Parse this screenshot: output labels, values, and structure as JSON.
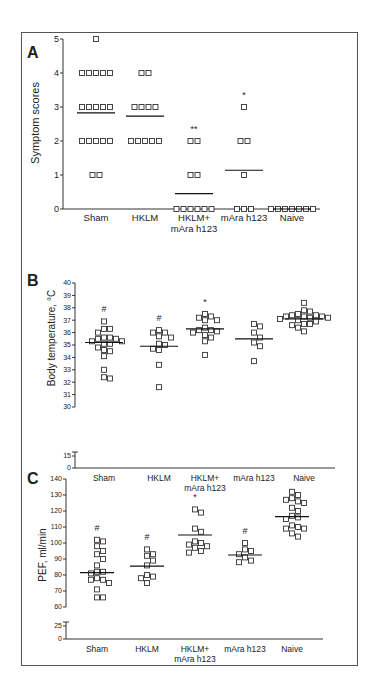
{
  "figure": {
    "panels": [
      "A",
      "B",
      "C"
    ]
  },
  "chart_data": [
    {
      "panel": "A",
      "type": "scatter",
      "title": "",
      "xlabel": "",
      "ylabel": "Symptom scores",
      "categories": [
        "Sham",
        "HKLM",
        "HKLM+\nmAra h123",
        "mAra h123",
        "Naive"
      ],
      "ylim": [
        0,
        5
      ],
      "yticks": [
        0,
        1,
        2,
        3,
        4,
        5
      ],
      "series": [
        {
          "name": "Sham",
          "values": [
            5,
            4,
            4,
            4,
            4,
            4,
            3,
            3,
            3,
            3,
            3,
            2,
            2,
            2,
            2,
            2,
            1,
            1
          ],
          "mean": 2.83,
          "annotation": ""
        },
        {
          "name": "HKLM",
          "values": [
            4,
            4,
            3,
            3,
            3,
            3,
            2,
            2,
            2,
            2,
            2
          ],
          "mean": 2.73,
          "annotation": ""
        },
        {
          "name": "HKLM+ mAra h123",
          "values": [
            2,
            2,
            1,
            1,
            0,
            0,
            0,
            0,
            0,
            0
          ],
          "mean": 0.45,
          "annotation": "**"
        },
        {
          "name": "mAra h123",
          "values": [
            3,
            2,
            2,
            1,
            0,
            0,
            0
          ],
          "mean": 1.14,
          "annotation": "*"
        },
        {
          "name": "Naive",
          "values": [
            0,
            0,
            0,
            0,
            0,
            0,
            0
          ],
          "mean": 0,
          "annotation": ""
        }
      ],
      "grid": false,
      "legend": null
    },
    {
      "panel": "B",
      "type": "scatter",
      "title": "",
      "xlabel": "",
      "ylabel": "Body temperature, °C",
      "categories": [
        "Sham",
        "HKLM",
        "HKLM+\nmAra h123",
        "mAra h123",
        "Naive"
      ],
      "ylim": [
        0,
        40
      ],
      "axis_break": [
        15,
        30
      ],
      "yticks": [
        0,
        15,
        30,
        31,
        32,
        33,
        34,
        35,
        36,
        37,
        38,
        39,
        40
      ],
      "series": [
        {
          "name": "Sham",
          "values": [
            36.9,
            36.3,
            36.3,
            36.0,
            35.6,
            35.5,
            35.5,
            35.6,
            35.3,
            35.3,
            35.1,
            35.1,
            34.8,
            34.6,
            34.5,
            34.1,
            33.0,
            32.3,
            32.4
          ],
          "mean": 35.2,
          "annotation": "#"
        },
        {
          "name": "HKLM",
          "values": [
            36.2,
            36.0,
            36.0,
            35.7,
            35.6,
            35.1,
            35.0,
            34.7,
            34.6,
            33.4,
            31.6
          ],
          "mean": 34.9,
          "annotation": "#"
        },
        {
          "name": "HKLM+ mAra h123",
          "values": [
            37.5,
            37.3,
            37.2,
            37.0,
            37.0,
            36.4,
            36.2,
            36.2,
            36.1,
            36.0,
            35.8,
            35.6,
            35.3,
            34.2
          ],
          "mean": 36.3,
          "annotation": "*"
        },
        {
          "name": "mAra h123",
          "values": [
            36.7,
            36.5,
            36.0,
            35.6,
            35.2,
            34.9,
            33.7
          ],
          "mean": 35.5,
          "annotation": ""
        },
        {
          "name": "Naive",
          "values": [
            38.4,
            37.8,
            37.7,
            37.4,
            37.4,
            37.5,
            37.3,
            37.3,
            37.2,
            37.1,
            37.3,
            37.2,
            37.0,
            36.9,
            36.7,
            36.7,
            36.6,
            36.4,
            36.1
          ],
          "mean": 37.1,
          "annotation": ""
        }
      ],
      "grid": false,
      "legend": null
    },
    {
      "panel": "C",
      "type": "scatter",
      "title": "",
      "xlabel": "",
      "ylabel": "PEF, ml/min",
      "categories": [
        "Sham",
        "HKLM",
        "HKLM+\nmAra h123",
        "mAra h123",
        "Naive"
      ],
      "ylim": [
        0,
        140
      ],
      "axis_break": [
        25,
        60
      ],
      "yticks": [
        0,
        25,
        60,
        70,
        80,
        90,
        100,
        110,
        120,
        130,
        140
      ],
      "series": [
        {
          "name": "Sham",
          "values": [
            102,
            101,
            98,
            95,
            93,
            90,
            86,
            82,
            82,
            81,
            78,
            77,
            77,
            75,
            71,
            66,
            66
          ],
          "mean": 81.5,
          "annotation": "#"
        },
        {
          "name": "HKLM",
          "values": [
            96,
            93,
            92,
            89,
            86,
            80,
            79,
            78,
            75
          ],
          "mean": 85.5,
          "annotation": "#"
        },
        {
          "name": "HKLM+ mAra h123",
          "values": [
            121,
            119,
            109,
            107,
            101,
            100,
            99,
            98,
            97,
            95,
            94
          ],
          "mean": 105,
          "annotation": "*"
        },
        {
          "name": "mAra h123",
          "values": [
            100,
            96,
            95,
            93,
            91,
            89,
            88
          ],
          "mean": 92.5,
          "annotation": "#"
        },
        {
          "name": "Naive",
          "values": [
            132,
            130,
            128,
            127,
            126,
            125,
            122,
            120,
            117,
            115,
            116,
            111,
            110,
            109,
            109,
            106,
            104
          ],
          "mean": 116.5,
          "annotation": ""
        }
      ],
      "grid": false,
      "legend": null
    }
  ],
  "labels": {
    "panel_a": "A",
    "panel_b": "B",
    "panel_c": "C",
    "ylabel_a": "Symptom scores",
    "ylabel_b": "Body temperature, °C",
    "ylabel_c": "PEF, ml/min",
    "cat_sham": "Sham",
    "cat_hklm": "HKLM",
    "cat_combo_1": "HKLM+",
    "cat_combo_2": "mAra h123",
    "cat_mara": "mAra h123",
    "cat_naive": "Naive"
  }
}
